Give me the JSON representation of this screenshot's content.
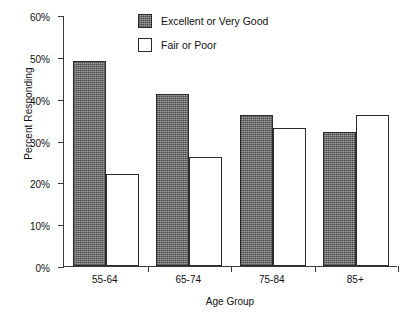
{
  "chart_data": {
    "type": "bar",
    "title": "",
    "xlabel": "Age Group",
    "ylabel": "Percent Responding",
    "categories": [
      "55-64",
      "65-74",
      "75-84",
      "85+"
    ],
    "series": [
      {
        "name": "Excellent or Very Good",
        "values": [
          49,
          41,
          36,
          32
        ],
        "fill": "gray-stipple"
      },
      {
        "name": "Fair or Poor",
        "values": [
          22,
          26,
          33,
          36
        ],
        "fill": "white"
      }
    ],
    "ylim": [
      0,
      60
    ],
    "yticks": [
      0,
      10,
      20,
      30,
      40,
      50,
      60
    ],
    "ytick_labels": [
      "0%",
      "10%",
      "20%",
      "30%",
      "40%",
      "50%",
      "60%"
    ],
    "grid": false,
    "legend_position": "top-center",
    "colors": {
      "series_1": "#a0a0a0",
      "series_2": "#ffffff",
      "outline": "#2b2b2b",
      "axis": "#3a3a3a",
      "text": "#111111",
      "background": "#ffffff"
    }
  },
  "legend": {
    "items": [
      {
        "label": "Excellent or Very Good"
      },
      {
        "label": "Fair or Poor"
      }
    ]
  },
  "axes": {
    "y_title": "Percent Responding",
    "x_title": "Age Group"
  }
}
